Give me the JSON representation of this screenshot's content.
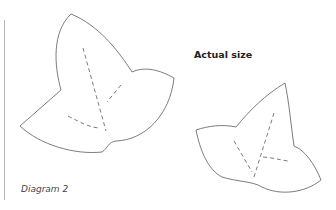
{
  "diagram": {
    "title": "Actual size",
    "caption": "Diagram 2",
    "shapes": [
      {
        "name": "large-ivy-leaf-template",
        "stroke": "#555555",
        "fold_lines": "dashed"
      },
      {
        "name": "small-ivy-leaf-template",
        "stroke": "#555555",
        "fold_lines": "dashed"
      }
    ]
  }
}
